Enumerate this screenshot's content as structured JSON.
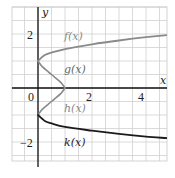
{
  "chart_data": {
    "type": "line",
    "title": "",
    "xlabel": "x",
    "ylabel": "y",
    "xlim": [
      -1,
      4.8
    ],
    "ylim": [
      -2.7,
      3
    ],
    "grid": true,
    "grid_step": 0.5,
    "x_ticks": [
      {
        "value": 0,
        "label": "0"
      },
      {
        "value": 2,
        "label": "2"
      },
      {
        "value": 4,
        "label": "4"
      }
    ],
    "y_ticks": [
      {
        "value": 2,
        "label": "2"
      },
      {
        "value": -2,
        "label": "−2"
      }
    ],
    "series": [
      {
        "name": "f(x)",
        "color": "#8a8a8a",
        "description": "upper branch starting at (0,1) rising slowly to the right",
        "points": [
          [
            0,
            1.0
          ],
          [
            0.25,
            1.22
          ],
          [
            0.5,
            1.31
          ],
          [
            1,
            1.44
          ],
          [
            2,
            1.62
          ],
          [
            3,
            1.76
          ],
          [
            4,
            1.88
          ],
          [
            4.8,
            1.96
          ]
        ]
      },
      {
        "name": "g(x)",
        "color": "#8a8a8a",
        "description": "upper half of bulge from (0,1) to (1,0)",
        "points": [
          [
            0,
            1.0
          ],
          [
            0.15,
            0.8
          ],
          [
            0.38,
            0.6
          ],
          [
            0.62,
            0.4
          ],
          [
            0.85,
            0.2
          ],
          [
            1.0,
            0.0
          ]
        ]
      },
      {
        "name": "h(x)",
        "color": "#8a8a8a",
        "description": "lower half of bulge from (1,0) to (0,-1)",
        "points": [
          [
            1.0,
            0.0
          ],
          [
            0.85,
            -0.2
          ],
          [
            0.62,
            -0.4
          ],
          [
            0.38,
            -0.6
          ],
          [
            0.15,
            -0.8
          ],
          [
            0,
            -1.0
          ]
        ]
      },
      {
        "name": "k(x)",
        "color": "#1a1a1a",
        "description": "lower branch starting at (0,-1) decreasing slowly to the right",
        "points": [
          [
            0,
            -1.0
          ],
          [
            0.25,
            -1.22
          ],
          [
            0.5,
            -1.31
          ],
          [
            1,
            -1.44
          ],
          [
            2,
            -1.58
          ],
          [
            3,
            -1.7
          ],
          [
            4,
            -1.8
          ],
          [
            4.8,
            -1.86
          ]
        ]
      }
    ],
    "annotations": [
      {
        "text": "f(x)",
        "x": 1.4,
        "y": 2.0
      },
      {
        "text": "g(x)",
        "x": 1.4,
        "y": 0.8
      },
      {
        "text": "h(x)",
        "x": 1.4,
        "y": -0.8
      },
      {
        "text": "k(x)",
        "x": 1.4,
        "y": -2.0
      }
    ]
  },
  "labels": {
    "x_axis": "x",
    "y_axis": "y",
    "tick_x0": "0",
    "tick_x2": "2",
    "tick_x4": "4",
    "tick_y2": "2",
    "tick_yneg2": "−2",
    "f": "f(x)",
    "g": "g(x)",
    "h": "h(x)",
    "k": "k(x)"
  }
}
